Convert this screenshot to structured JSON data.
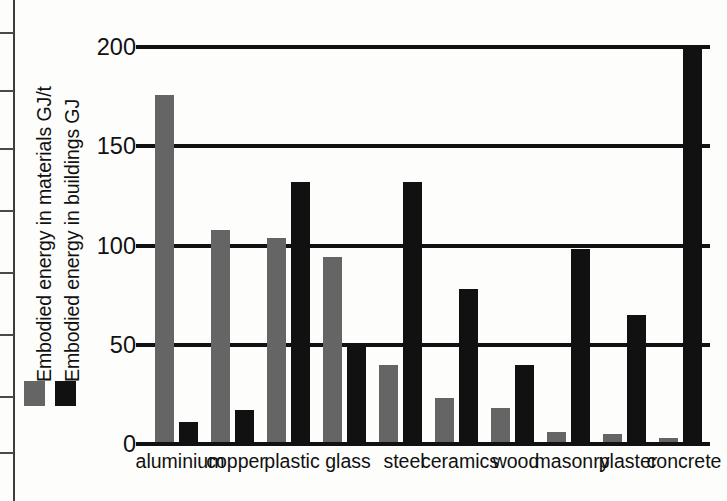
{
  "chart_data": {
    "type": "bar",
    "title": "",
    "xlabel": "",
    "ylabel": "Embodied energy",
    "ylim": [
      0,
      200
    ],
    "yticks": [
      0,
      50,
      100,
      150,
      200
    ],
    "grid": true,
    "legend_position": "left",
    "categories": [
      "aluminium",
      "copper",
      "plastic",
      "glass",
      "steel",
      "ceramics",
      "wood",
      "masonry",
      "plaster",
      "concrete"
    ],
    "series": [
      {
        "name": "Embodied energy in materials GJ/t",
        "color": "#656565",
        "values": [
          176,
          108,
          104,
          94,
          40,
          23,
          18,
          6,
          5,
          3
        ]
      },
      {
        "name": "Embodied energy in buildings GJ",
        "color": "#111111",
        "values": [
          11,
          17,
          132,
          50,
          132,
          78,
          40,
          98,
          65,
          201
        ]
      }
    ]
  },
  "axis": {
    "title_materials": "Embodied energy in materials GJ/t",
    "title_buildings": "Embodied energy in buildings GJ",
    "tick_labels": [
      "200",
      "150",
      "100",
      "50",
      "0"
    ]
  },
  "legend": {
    "items": [
      {
        "name": "legend-swatch-materials",
        "color": "#656565"
      },
      {
        "name": "legend-swatch-buildings",
        "color": "#111111"
      }
    ]
  },
  "colors": {
    "series_materials": "#656565",
    "series_buildings": "#111111",
    "axis": "#111111",
    "background": "#fdfdfc"
  }
}
